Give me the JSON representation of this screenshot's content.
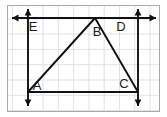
{
  "figure": {
    "type": "euclidean-geometry-diagram",
    "canvas": {
      "width": 167,
      "height": 117
    },
    "frame": {
      "x": 7,
      "y": 5,
      "width": 153,
      "height": 107,
      "stroke": "#a8a8a8",
      "fill": "#ffffff"
    },
    "grid": {
      "visible": true,
      "cell_size": 15.3,
      "origin_x": 12.4,
      "origin_y": 3.5,
      "color": "#d3dce3",
      "stroke_width": 0.8
    },
    "colors": {
      "line": "#111111",
      "grid": "#d3dce3",
      "frame": "#a8a8a8",
      "background": "#ffffff",
      "label": "#1a1a1a"
    },
    "points": [
      {
        "name": "A",
        "x": 28,
        "y": 92,
        "label": "A",
        "label_x": 37,
        "label_y": 90
      },
      {
        "name": "B",
        "x": 95,
        "y": 18,
        "label": "B",
        "label_x": 97,
        "label_y": 36
      },
      {
        "name": "C",
        "x": 138,
        "y": 92,
        "label": "C",
        "label_x": 124,
        "label_y": 88
      },
      {
        "name": "D",
        "x": 138,
        "y": 18,
        "label": "D",
        "label_x": 121,
        "label_y": 31
      },
      {
        "name": "E",
        "x": 28,
        "y": 18,
        "label": "E",
        "label_x": 33,
        "label_y": 31
      }
    ],
    "segments": [
      {
        "name": "segment-AB",
        "from": "A",
        "to": "B",
        "x1": 28,
        "y1": 92,
        "x2": 95,
        "y2": 18,
        "stroke_width": 1.9
      },
      {
        "name": "segment-BC",
        "from": "B",
        "to": "C",
        "x1": 95,
        "y1": 18,
        "x2": 138,
        "y2": 92,
        "stroke_width": 1.9
      },
      {
        "name": "segment-AC",
        "from": "A",
        "to": "C",
        "x1": 28,
        "y1": 92,
        "x2": 138,
        "y2": 92,
        "stroke_width": 1.9
      }
    ],
    "lines": [
      {
        "name": "horizontal-line-ED",
        "orientation": "horizontal",
        "x1": 12,
        "y1": 18,
        "x2": 156,
        "y2": 18,
        "arrow_start": true,
        "arrow_end": true,
        "through": [
          "E",
          "B",
          "D"
        ],
        "stroke_width": 1.9
      },
      {
        "name": "vertical-line-EA",
        "orientation": "vertical",
        "x1": 28,
        "y1": 9,
        "x2": 28,
        "y2": 106,
        "arrow_start": true,
        "arrow_end": true,
        "through": [
          "E",
          "A"
        ],
        "stroke_width": 1.9
      },
      {
        "name": "vertical-line-DC",
        "orientation": "vertical",
        "x1": 138,
        "y1": 9,
        "x2": 138,
        "y2": 106,
        "arrow_start": true,
        "arrow_end": true,
        "through": [
          "D",
          "C"
        ],
        "stroke_width": 1.9
      }
    ],
    "arrowheads": [
      {
        "name": "arrow-left-top",
        "direction": "left",
        "x": 12,
        "y": 18
      },
      {
        "name": "arrow-right-top",
        "direction": "right",
        "x": 156,
        "y": 18
      },
      {
        "name": "arrow-up-left",
        "direction": "up",
        "x": 28,
        "y": 9
      },
      {
        "name": "arrow-down-left",
        "direction": "down",
        "x": 28,
        "y": 106
      },
      {
        "name": "arrow-up-right",
        "direction": "up",
        "x": 138,
        "y": 9
      },
      {
        "name": "arrow-down-right",
        "direction": "down",
        "x": 138,
        "y": 106
      }
    ],
    "labels": {
      "A": "A",
      "B": "B",
      "C": "C",
      "D": "D",
      "E": "E"
    }
  }
}
